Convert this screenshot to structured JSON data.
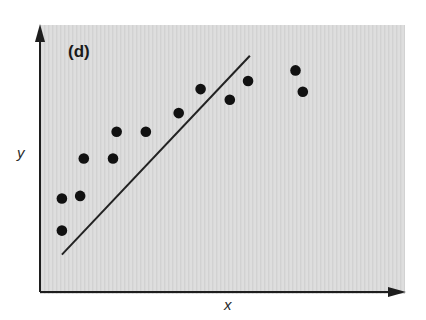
{
  "chart_data": {
    "type": "scatter",
    "title": "",
    "panel_label": "(d)",
    "xlabel": "x",
    "ylabel": "y",
    "xlim": [
      0,
      10
    ],
    "ylim": [
      0,
      10
    ],
    "grid": false,
    "ticks": "none",
    "background_color": "#dcdcdc",
    "point_color": "#111111",
    "line_color": "#222222",
    "series": [
      {
        "name": "data points",
        "kind": "scatter",
        "points": [
          {
            "x": 0.6,
            "y": 2.3
          },
          {
            "x": 0.6,
            "y": 3.5
          },
          {
            "x": 1.1,
            "y": 3.6
          },
          {
            "x": 1.2,
            "y": 5.0
          },
          {
            "x": 2.0,
            "y": 5.0
          },
          {
            "x": 2.1,
            "y": 6.0
          },
          {
            "x": 2.9,
            "y": 6.0
          },
          {
            "x": 3.8,
            "y": 6.7
          },
          {
            "x": 4.4,
            "y": 7.6
          },
          {
            "x": 5.2,
            "y": 7.2
          },
          {
            "x": 5.7,
            "y": 7.9
          },
          {
            "x": 7.0,
            "y": 8.3
          },
          {
            "x": 7.2,
            "y": 7.5
          }
        ]
      },
      {
        "name": "fitted line",
        "kind": "line",
        "points": [
          {
            "x": 0.6,
            "y": 1.4
          },
          {
            "x": 5.75,
            "y": 8.85
          }
        ]
      }
    ]
  },
  "layout": {
    "plot_px": {
      "left": 40,
      "right": 405,
      "top": 25,
      "bottom": 292
    }
  }
}
